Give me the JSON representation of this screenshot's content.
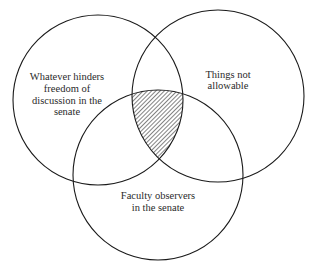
{
  "diagram": {
    "type": "venn",
    "title": "",
    "colors": {
      "stroke": "#1a1a1a",
      "hatch": "#1a1a1a",
      "background": "#ffffff",
      "text": "#2a2a2a"
    },
    "sets": [
      {
        "id": "left",
        "label_lines": [
          "Whatever hinders",
          "freedom of",
          "discussion in the",
          "senate"
        ]
      },
      {
        "id": "right",
        "label_lines": [
          "Things not",
          "allowable"
        ]
      },
      {
        "id": "bottom",
        "label_lines": [
          "Faculty observers",
          "in the senate"
        ]
      }
    ],
    "shaded_region": {
      "intersection_of": [
        "left",
        "bottom"
      ],
      "excluding": [
        "right"
      ],
      "fill": "diagonal-hatch"
    }
  }
}
